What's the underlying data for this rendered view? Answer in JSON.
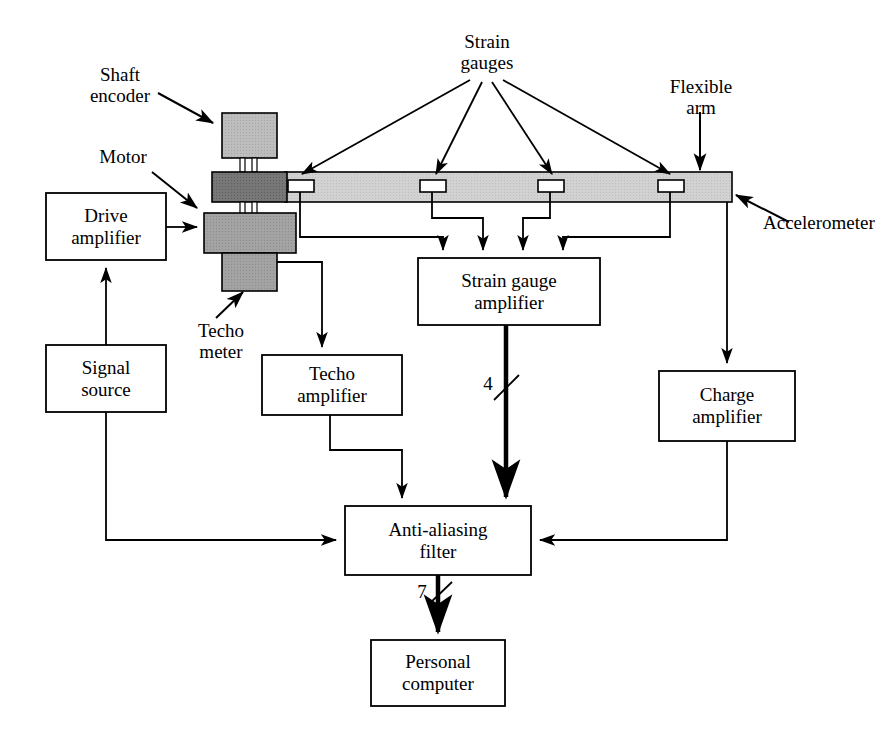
{
  "diagram": {
    "stroke_color": "#000000",
    "fill_white": "#ffffff",
    "colors": {
      "beam": "#cfcfcf",
      "encoder": "#c0c0c0",
      "motor": "#808080",
      "tacho": "#a8a8a8",
      "gauge": "#ffffff"
    }
  },
  "callouts": [
    {
      "id": "shaft-encoder",
      "lines": [
        "Shaft",
        "encoder"
      ]
    },
    {
      "id": "motor",
      "lines": [
        "Motor"
      ]
    },
    {
      "id": "techo-meter",
      "lines": [
        "Techo",
        "meter"
      ]
    },
    {
      "id": "strain-gauges",
      "lines": [
        "Strain",
        "gauges"
      ]
    },
    {
      "id": "flexible-arm",
      "lines": [
        "Flexible",
        "arm"
      ]
    },
    {
      "id": "accelerometer",
      "lines": [
        "Accelerometer"
      ]
    }
  ],
  "boxes": [
    {
      "id": "drive-amplifier",
      "lines": [
        "Drive",
        "amplifier"
      ]
    },
    {
      "id": "signal-source",
      "lines": [
        "Signal",
        "source"
      ]
    },
    {
      "id": "techo-amplifier",
      "lines": [
        "Techo",
        "amplifier"
      ]
    },
    {
      "id": "strain-gauge-amplifier",
      "lines": [
        "Strain gauge",
        "amplifier"
      ]
    },
    {
      "id": "charge-amplifier",
      "lines": [
        "Charge",
        "amplifier"
      ]
    },
    {
      "id": "anti-aliasing-filter",
      "lines": [
        "Anti-aliasing",
        "filter"
      ]
    },
    {
      "id": "personal-computer",
      "lines": [
        "Personal",
        "computer"
      ]
    }
  ],
  "bus_labels": [
    {
      "id": "strain-bus-count",
      "value": "4"
    },
    {
      "id": "filter-bus-count",
      "value": "7"
    }
  ],
  "labels": {
    "shaft_encoder_l1": "Shaft",
    "shaft_encoder_l2": "encoder",
    "motor": "Motor",
    "techo_meter_l1": "Techo",
    "techo_meter_l2": "meter",
    "strain_gauges_l1": "Strain",
    "strain_gauges_l2": "gauges",
    "flexible_arm_l1": "Flexible",
    "flexible_arm_l2": "arm",
    "accelerometer": "Accelerometer",
    "drive_amplifier_l1": "Drive",
    "drive_amplifier_l2": "amplifier",
    "signal_source_l1": "Signal",
    "signal_source_l2": "source",
    "techo_amplifier_l1": "Techo",
    "techo_amplifier_l2": "amplifier",
    "strain_gauge_amplifier_l1": "Strain gauge",
    "strain_gauge_amplifier_l2": "amplifier",
    "charge_amplifier_l1": "Charge",
    "charge_amplifier_l2": "amplifier",
    "anti_aliasing_filter_l1": "Anti-aliasing",
    "anti_aliasing_filter_l2": "filter",
    "personal_computer_l1": "Personal",
    "personal_computer_l2": "computer",
    "bus4": "4",
    "bus7": "7"
  }
}
